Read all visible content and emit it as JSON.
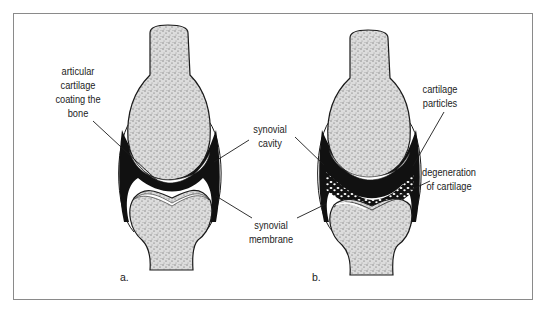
{
  "figure": {
    "panels": [
      {
        "id": "a",
        "letter": "a.",
        "state": "healthy joint"
      },
      {
        "id": "b",
        "letter": "b.",
        "state": "degenerated joint"
      }
    ],
    "labels": {
      "articular_cartilage": {
        "line1": "articular",
        "line2": "cartilage",
        "line3": "coating the",
        "line4": "bone"
      },
      "synovial_cavity": {
        "line1": "synovial",
        "line2": "cavity"
      },
      "synovial_membrane": {
        "line1": "synovial",
        "line2": "membrane"
      },
      "cartilage_particles": {
        "line1": "cartilage",
        "line2": "particles"
      },
      "degeneration": {
        "line1": "degeneration",
        "line2": "of cartilage"
      }
    },
    "colors": {
      "frame": "#8a8a8a",
      "bone_fill": "#d9d9d9",
      "outline": "#1a1a1a",
      "cavity": "#111111",
      "cartilage": "#ffffff"
    }
  }
}
